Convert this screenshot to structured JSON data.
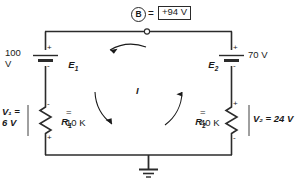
{
  "figure": {
    "type": "circuit-schematic"
  },
  "top_label": {
    "node_name": "B",
    "equals": "=",
    "value": "+94 V"
  },
  "left_source": {
    "value": "100\nV",
    "name": "E",
    "subscript": "1",
    "plus": "+",
    "minus": "-"
  },
  "right_source": {
    "name": "E",
    "subscript": "2",
    "value": "70 V",
    "plus": "+",
    "minus": "-"
  },
  "left_resistor": {
    "drop_label": "V₁ =\n6 V",
    "name": "R",
    "subscript": "1",
    "value": "=\n10 K",
    "top_sign": "-",
    "bottom_sign": "+"
  },
  "right_resistor": {
    "name": "R",
    "subscript": "2",
    "value": "=\n40 K",
    "drop_label": "V₂ = 24 V",
    "top_sign": "+",
    "bottom_sign": "-"
  },
  "current": {
    "label": "I",
    "direction": "counterclockwise"
  },
  "ground": {
    "label": ""
  },
  "colors": {
    "wire": "#2b2b2b",
    "text": "#1a1a1a",
    "background": "#ffffff"
  }
}
